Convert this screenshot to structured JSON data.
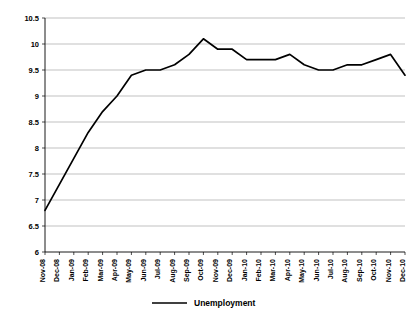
{
  "chart_data": {
    "type": "line",
    "title": "",
    "xlabel": "",
    "ylabel": "",
    "ylim": [
      6,
      10.5
    ],
    "y_ticks": [
      "6",
      "6.5",
      "7",
      "7.5",
      "8",
      "8.5",
      "9",
      "9.5",
      "10",
      "10.5"
    ],
    "y_tick_values": [
      6,
      6.5,
      7,
      7.5,
      8,
      8.5,
      9,
      9.5,
      10,
      10.5
    ],
    "grid": true,
    "legend_position": "bottom-center",
    "categories": [
      "Nov-08",
      "Dec-08",
      "Jan-09",
      "Feb-09",
      "Mar-09",
      "Apr-09",
      "May-09",
      "Jun-09",
      "Jul-09",
      "Aug-09",
      "Sep-09",
      "Oct-09",
      "Nov-09",
      "Dec-09",
      "Jan-10",
      "Feb-10",
      "Mar-10",
      "Apr-10",
      "May-10",
      "Jun-10",
      "Jul-10",
      "Aug-10",
      "Sep-10",
      "Oct-10",
      "Nov-10",
      "Dec-10"
    ],
    "series": [
      {
        "name": "Unemployment",
        "values": [
          6.8,
          7.3,
          7.8,
          8.3,
          8.7,
          9.0,
          9.4,
          9.5,
          9.5,
          9.6,
          9.8,
          10.1,
          9.9,
          9.9,
          9.7,
          9.7,
          9.7,
          9.8,
          9.6,
          9.5,
          9.5,
          9.6,
          9.6,
          9.7,
          9.8,
          9.4
        ],
        "color": "#000000"
      }
    ]
  },
  "legend": {
    "entries": [
      {
        "label": "Unemployment"
      }
    ]
  }
}
